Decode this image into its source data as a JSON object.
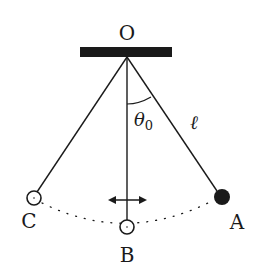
{
  "diagram": {
    "colors": {
      "ink": "#1a1a1a",
      "background": "#ffffff"
    },
    "support": {
      "label": "O"
    },
    "angle_label": "θ",
    "angle_subscript": "0",
    "length_label": "ℓ",
    "positions": [
      {
        "id": "A",
        "label": "A",
        "bob": "filled"
      },
      {
        "id": "B",
        "label": "B",
        "bob": "hollow"
      },
      {
        "id": "C",
        "label": "C",
        "bob": "hollow"
      }
    ],
    "velocity_arrow": "double-headed horizontal arrow at B"
  }
}
